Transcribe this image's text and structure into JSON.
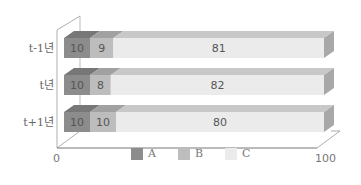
{
  "chart_data": {
    "type": "bar",
    "orientation": "horizontal",
    "stacked": true,
    "three_d": true,
    "categories": [
      "t-1년",
      "t년",
      "t+1년"
    ],
    "series": [
      {
        "name": "A",
        "values": [
          10,
          10,
          10
        ],
        "color": "#8c8c8c"
      },
      {
        "name": "B",
        "values": [
          9,
          8,
          10
        ],
        "color": "#bdbdbd"
      },
      {
        "name": "C",
        "values": [
          81,
          82,
          80
        ],
        "color": "#ebebeb"
      }
    ],
    "title": "",
    "xlabel": "",
    "ylabel": "",
    "xlim": [
      0,
      100
    ],
    "x_ticks": [
      "0",
      "100"
    ],
    "grid": false,
    "legend_position": "bottom"
  },
  "labels": {
    "cat0": "t-1년",
    "cat1": "t년",
    "cat2": "t+1년",
    "tick_min": "0",
    "tick_max": "100",
    "legend_a": "A",
    "legend_b": "B",
    "legend_c": "C"
  }
}
